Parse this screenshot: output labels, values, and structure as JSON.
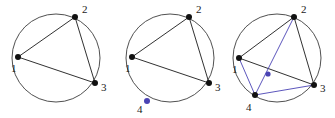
{
  "figure": {
    "background_color": "#ffffff",
    "width": 335,
    "height": 118,
    "colors": {
      "black": "#111111",
      "circle_stroke": "#3c3c3c",
      "blue": "#4a43b4"
    }
  },
  "panels": [
    {
      "id": "panel-1",
      "circle": {
        "cx": 56,
        "cy": 58,
        "r": 44
      },
      "vertices": [
        {
          "id": "p1",
          "label": "1",
          "x": 18,
          "y": 57,
          "color": "black",
          "label_x": 11,
          "label_y": 72
        },
        {
          "id": "p2",
          "label": "2",
          "x": 75,
          "y": 17,
          "color": "black",
          "label_x": 82,
          "label_y": 13
        },
        {
          "id": "p3",
          "label": "3",
          "x": 95,
          "y": 83,
          "color": "black",
          "label_x": 101,
          "label_y": 91
        }
      ],
      "chords": [
        {
          "from": "p1",
          "to": "p2",
          "color": "black"
        },
        {
          "from": "p2",
          "to": "p3",
          "color": "black"
        },
        {
          "from": "p1",
          "to": "p3",
          "color": "black"
        }
      ],
      "intersections": []
    },
    {
      "id": "panel-2",
      "circle": {
        "cx": 170,
        "cy": 58,
        "r": 44
      },
      "vertices": [
        {
          "id": "p1",
          "label": "1",
          "x": 132,
          "y": 57,
          "color": "black",
          "label_x": 125,
          "label_y": 72
        },
        {
          "id": "p2",
          "label": "2",
          "x": 189,
          "y": 17,
          "color": "black",
          "label_x": 196,
          "label_y": 13
        },
        {
          "id": "p3",
          "label": "3",
          "x": 209,
          "y": 83,
          "color": "black",
          "label_x": 215,
          "label_y": 91
        },
        {
          "id": "p4",
          "label": "4",
          "x": 147,
          "y": 101,
          "color": "blue",
          "label_x": 137,
          "label_y": 113
        }
      ],
      "chords": [
        {
          "from": "p1",
          "to": "p2",
          "color": "black"
        },
        {
          "from": "p2",
          "to": "p3",
          "color": "black"
        },
        {
          "from": "p1",
          "to": "p3",
          "color": "black"
        }
      ],
      "intersections": []
    },
    {
      "id": "panel-3",
      "circle": {
        "cx": 277,
        "cy": 58,
        "r": 44
      },
      "vertices": [
        {
          "id": "p1",
          "label": "1",
          "x": 239,
          "y": 58,
          "color": "black",
          "label_x": 232,
          "label_y": 73
        },
        {
          "id": "p2",
          "label": "2",
          "x": 294,
          "y": 17,
          "color": "black",
          "label_x": 301,
          "label_y": 13
        },
        {
          "id": "p3",
          "label": "3",
          "x": 314,
          "y": 85,
          "color": "black",
          "label_x": 320,
          "label_y": 92
        },
        {
          "id": "p4",
          "label": "4",
          "x": 255,
          "y": 95,
          "color": "black",
          "label_x": 246,
          "label_y": 111
        }
      ],
      "chords": [
        {
          "from": "p1",
          "to": "p2",
          "color": "black"
        },
        {
          "from": "p2",
          "to": "p3",
          "color": "black"
        },
        {
          "from": "p1",
          "to": "p3",
          "color": "black"
        },
        {
          "from": "p1",
          "to": "p4",
          "color": "blue"
        },
        {
          "from": "p2",
          "to": "p4",
          "color": "blue"
        },
        {
          "from": "p3",
          "to": "p4",
          "color": "blue"
        }
      ],
      "intersections": [
        {
          "id": "x1",
          "x": 268,
          "y": 74,
          "color": "blue",
          "between": [
            "p2-p4",
            "p1-p3"
          ]
        }
      ]
    }
  ]
}
